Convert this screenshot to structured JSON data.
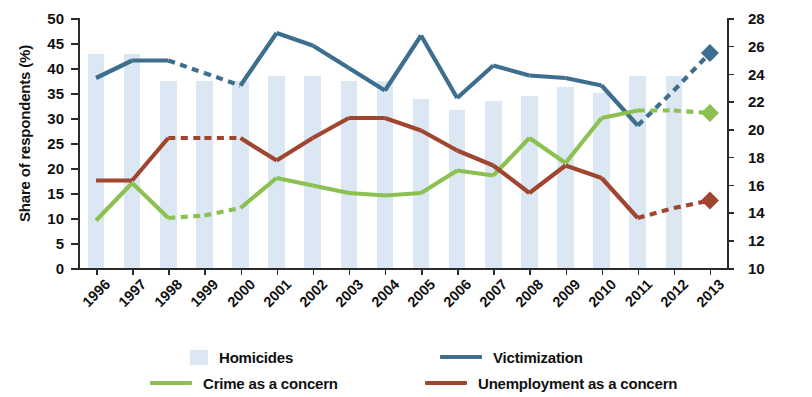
{
  "chart_data": {
    "type": "bar",
    "title": "",
    "categories": [
      "1996",
      "1997",
      "1998",
      "1999",
      "2000",
      "2001",
      "2002",
      "2003",
      "2004",
      "2005",
      "2006",
      "2007",
      "2008",
      "2009",
      "2010",
      "2011",
      "2012",
      "2013"
    ],
    "xlabel": "",
    "ylabel": "Share of respondents (%)",
    "ylabel_right": "Homicide rate (per 100,000 inhabitants)",
    "ylim": [
      0,
      50
    ],
    "yticks": [
      0,
      5,
      10,
      15,
      20,
      25,
      30,
      35,
      40,
      45,
      50
    ],
    "ylim_right": [
      10,
      28
    ],
    "yticks_right": [
      10,
      12,
      14,
      16,
      18,
      20,
      22,
      24,
      26,
      28
    ],
    "grid": false,
    "legend_position": "bottom",
    "series": [
      {
        "name": "Homicides",
        "type": "bar",
        "axis": "right",
        "color": "#dbe7f2",
        "values": [
          25.4,
          25.4,
          23.5,
          23.5,
          23.5,
          23.8,
          23.8,
          23.5,
          23.5,
          22.2,
          21.4,
          22.0,
          22.4,
          23.0,
          22.6,
          23.8,
          23.8,
          null
        ]
      },
      {
        "name": "Victimization",
        "type": "line",
        "axis": "left",
        "color": "#3e6e8e",
        "values": [
          38,
          41.5,
          41.5,
          39,
          36.5,
          47,
          44.5,
          40,
          35.5,
          46.5,
          34,
          40.5,
          38.5,
          38,
          36.5,
          28.5,
          35.5,
          43
        ],
        "dashed_segments": [
          [
            1998,
            2000
          ],
          [
            2011,
            2013
          ]
        ],
        "marker_2013": "diamond"
      },
      {
        "name": "Crime as a concern",
        "type": "line",
        "axis": "left",
        "color": "#8cc152",
        "values": [
          9.5,
          17,
          10,
          10.5,
          12,
          18,
          16.5,
          15,
          14.5,
          15,
          19.5,
          18.5,
          26,
          21,
          30,
          31.5,
          31.5,
          31
        ],
        "dashed_segments": [
          [
            1998,
            2000
          ],
          [
            2011,
            2013
          ]
        ],
        "marker_2013": "diamond"
      },
      {
        "name": "Unemployment as a concern",
        "type": "line",
        "axis": "left",
        "color": "#a0452f",
        "values": [
          17.5,
          17.5,
          26,
          26,
          26,
          21.5,
          26,
          30,
          30,
          27.5,
          23.5,
          20.5,
          15,
          20.5,
          18,
          10,
          12,
          13.5
        ],
        "dashed_segments": [
          [
            1998,
            2000
          ],
          [
            2011,
            2013
          ]
        ],
        "marker_2013": "diamond"
      }
    ]
  },
  "legend": {
    "items": [
      {
        "label": "Homicides",
        "marker": "bar-swatch",
        "color": "#dbe7f2"
      },
      {
        "label": "Victimization",
        "marker": "line-swatch",
        "color": "#3e6e8e"
      },
      {
        "label": "Crime as a concern",
        "marker": "line-swatch",
        "color": "#8cc152"
      },
      {
        "label": "Unemployment as a concern",
        "marker": "line-swatch",
        "color": "#a0452f"
      }
    ]
  }
}
